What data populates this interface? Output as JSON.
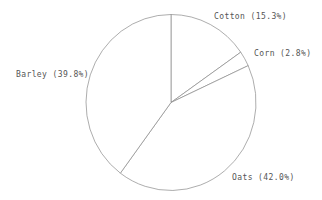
{
  "chart_data": {
    "type": "pie",
    "title": "",
    "start_angle": "12 o'clock",
    "direction": "clockwise",
    "slices": [
      {
        "label": "Cotton",
        "value": 15.3,
        "text": "Cotton (15.3%)"
      },
      {
        "label": "Corn",
        "value": 2.8,
        "text": "Corn (2.8%)"
      },
      {
        "label": "Oats",
        "value": 42.0,
        "text": "Oats (42.0%)"
      },
      {
        "label": "Barley",
        "value": 39.8,
        "text": "Barley (39.8%)"
      }
    ],
    "categories": [
      "Cotton",
      "Corn",
      "Oats",
      "Barley"
    ],
    "values": [
      15.3,
      2.8,
      42.0,
      39.8
    ],
    "legend": "none (labels beside slices)",
    "colors": {
      "stroke": "#8a8a8a",
      "fill": "#ffffff",
      "text": "#555555"
    }
  },
  "labels": {
    "cotton": "Cotton (15.3%)",
    "corn": "Corn (2.8%)",
    "oats": "Oats (42.0%)",
    "barley": "Barley (39.8%)"
  }
}
